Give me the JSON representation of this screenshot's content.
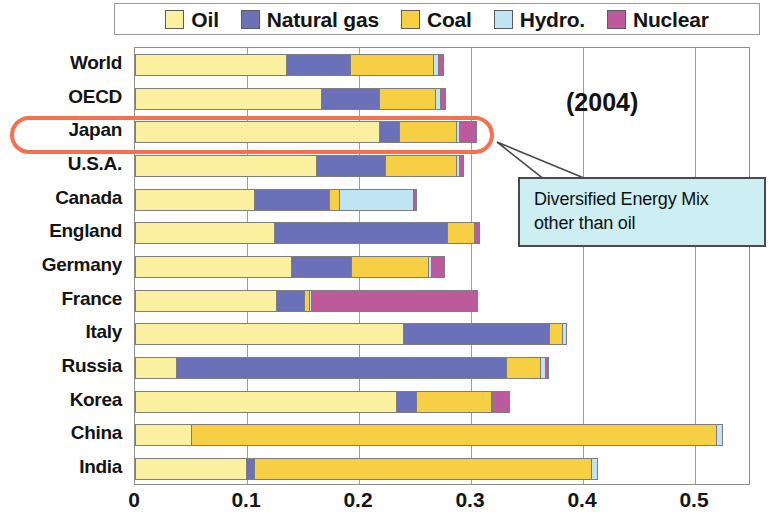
{
  "legend": {
    "items": [
      {
        "label": "Oil",
        "color": "#faf0a0"
      },
      {
        "label": "Natural gas",
        "color": "#6b71b8"
      },
      {
        "label": "Coal",
        "color": "#f7cf44"
      },
      {
        "label": "Hydro.",
        "color": "#bfe4f4"
      },
      {
        "label": "Nuclear",
        "color": "#bd5a9b"
      }
    ]
  },
  "annotations": {
    "year": "(2004)",
    "callout_line1": "Diversified Energy Mix",
    "callout_line2": "other than oil",
    "highlight_row": "Japan",
    "highlight_color": "#f4704f",
    "callout_bg": "#cdeef2"
  },
  "axis": {
    "ticks": [
      "0",
      "0.1",
      "0.2",
      "0.3",
      "0.4",
      "0.5"
    ],
    "tick_values": [
      0,
      0.1,
      0.2,
      0.3,
      0.4,
      0.5
    ],
    "xmin": 0,
    "xmax": 0.55
  },
  "chart_data": {
    "type": "bar",
    "orientation": "horizontal",
    "stacked": true,
    "title": "",
    "subtitle": "(2004)",
    "xlabel": "",
    "ylabel": "",
    "xlim": [
      0,
      0.55
    ],
    "grid": true,
    "legend_position": "top",
    "categories": [
      "World",
      "OECD",
      "Japan",
      "U.S.A.",
      "Canada",
      "England",
      "Germany",
      "France",
      "Italy",
      "Russia",
      "Korea",
      "China",
      "India"
    ],
    "series": [
      {
        "name": "Oil",
        "color": "#faf0a0",
        "values": [
          0.135,
          0.166,
          0.218,
          0.162,
          0.106,
          0.124,
          0.139,
          0.126,
          0.239,
          0.037,
          0.233,
          0.05,
          0.099
        ]
      },
      {
        "name": "Natural gas",
        "color": "#6b71b8",
        "values": [
          0.057,
          0.052,
          0.018,
          0.061,
          0.067,
          0.155,
          0.054,
          0.025,
          0.131,
          0.294,
          0.018,
          0.0,
          0.007
        ]
      },
      {
        "name": "Coal",
        "color": "#f7cf44",
        "values": [
          0.074,
          0.05,
          0.051,
          0.064,
          0.009,
          0.024,
          0.069,
          0.004,
          0.011,
          0.031,
          0.067,
          0.469,
          0.301
        ]
      },
      {
        "name": "Hydro.",
        "color": "#bfe4f4",
        "values": [
          0.005,
          0.004,
          0.002,
          0.002,
          0.066,
          0.001,
          0.002,
          0.002,
          0.005,
          0.004,
          0.001,
          0.006,
          0.006
        ]
      },
      {
        "name": "Nuclear",
        "color": "#bd5a9b",
        "values": [
          0.005,
          0.006,
          0.016,
          0.005,
          0.004,
          0.004,
          0.013,
          0.149,
          0.0,
          0.004,
          0.016,
          0.0,
          0.0
        ]
      }
    ],
    "totals": [
      0.276,
      0.278,
      0.305,
      0.294,
      0.252,
      0.308,
      0.277,
      0.306,
      0.386,
      0.37,
      0.335,
      0.525,
      0.413
    ]
  }
}
